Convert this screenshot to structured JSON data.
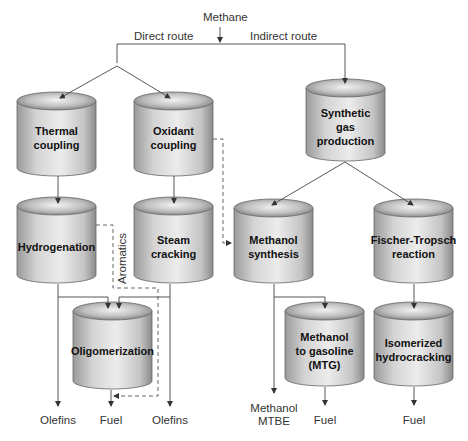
{
  "diagram": {
    "source": "Methane",
    "routes": {
      "direct": "Direct route",
      "indirect": "Indirect route"
    },
    "units": {
      "thermal_coupling": "Thermal\ncoupling",
      "oxidant_coupling": "Oxidant\ncoupling",
      "synthetic_gas": "Synthetic\ngas\nproduction",
      "hydrogenation": "Hydrogenation",
      "steam_cracking": "Steam cracking",
      "methanol_synthesis": "Methanol\nsynthesis",
      "fischer_tropsch": "Fischer-Tropsch\nreaction",
      "oligomerization": "Oligomerization",
      "mtg": "Methanol\nto gasoline\n(MTG)",
      "isomerized_hydrocracking": "Isomerized\nhydrocracking"
    },
    "side_label": "Aromatics",
    "outputs": {
      "olefins_left": "Olefins",
      "fuel_oligo": "Fuel",
      "olefins_right": "Olefins",
      "methanol_mtbe": "Methanol\nMTBE",
      "fuel_mtg": "Fuel",
      "fuel_ft": "Fuel"
    },
    "colors": {
      "line": "#444444",
      "cylinder_light": "#e6e6e6",
      "cylinder_dark": "#8c8c8c",
      "text": "#111111"
    }
  }
}
